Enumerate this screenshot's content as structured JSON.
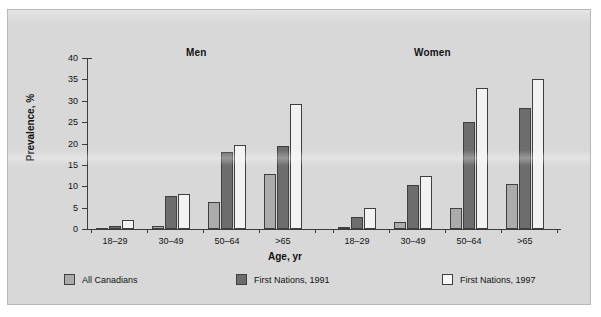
{
  "chart_data": {
    "type": "bar",
    "title": "",
    "xlabel": "Age, yr",
    "ylabel": "Prevalence, %",
    "ylim": [
      0,
      40
    ],
    "yticks": [
      0,
      5,
      10,
      15,
      20,
      25,
      30,
      35,
      40
    ],
    "ytick_labels": [
      "0",
      "5",
      "10",
      "15",
      "20",
      "25",
      "30",
      "35",
      "40"
    ],
    "grid": false,
    "legend_position": "bottom",
    "panels": [
      {
        "name": "Men",
        "categories": [
          "18–29",
          "30–49",
          "50–64",
          ">65"
        ],
        "series": [
          {
            "name": "All Canadians",
            "values": [
              0.3,
              0.8,
              6.3,
              12.8
            ]
          },
          {
            "name": "First Nations, 1991",
            "values": [
              0.7,
              7.8,
              18.0,
              19.4
            ]
          },
          {
            "name": "First Nations, 1997",
            "values": [
              2.2,
              8.3,
              19.7,
              29.2
            ]
          }
        ]
      },
      {
        "name": "Women",
        "categories": [
          "18–29",
          "30–49",
          "50–64",
          ">65"
        ],
        "series": [
          {
            "name": "All Canadians",
            "values": [
              0.4,
              1.7,
              4.9,
              10.5
            ]
          },
          {
            "name": "First Nations, 1991",
            "values": [
              2.8,
              10.4,
              25.0,
              28.3
            ]
          },
          {
            "name": "First Nations, 1997",
            "values": [
              5.0,
              12.5,
              33.0,
              35.0
            ]
          }
        ]
      }
    ],
    "legend": [
      {
        "label": "All Canadians",
        "color": "#ababab"
      },
      {
        "label": "First Nations, 1991",
        "color": "#6d6d6d"
      },
      {
        "label": "First Nations, 1997",
        "color": "#f7f7f7"
      }
    ]
  },
  "figure": {
    "background": "#d8d8d8",
    "axis_color": "#3b3b3b",
    "text_color": "#121212"
  }
}
